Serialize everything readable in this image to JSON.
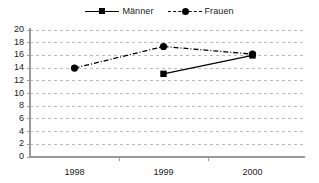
{
  "chart_data": {
    "type": "line",
    "title": "",
    "subtitle": "",
    "xlabel": "",
    "ylabel": "",
    "categories": [
      "1998",
      "1999",
      "2000"
    ],
    "ylim": [
      0,
      20
    ],
    "yticks": [
      0,
      2,
      4,
      6,
      8,
      10,
      12,
      14,
      16,
      18,
      20
    ],
    "grid": true,
    "grid_axis": "y",
    "grid_style": "dashed",
    "legend_position": "top-center",
    "series": [
      {
        "name": "Männer",
        "values": [
          null,
          13.1,
          16.0
        ],
        "line_style": "solid",
        "marker": "square",
        "color": "#000000"
      },
      {
        "name": "Frauen",
        "values": [
          14.0,
          17.4,
          16.2
        ],
        "line_style": "dash-dot",
        "marker": "circle",
        "color": "#000000"
      }
    ]
  },
  "legend": {
    "entries": [
      {
        "label": "Männer",
        "marker": "square-marker",
        "line": "solid-line"
      },
      {
        "label": "Frauen",
        "marker": "circle-marker",
        "line": "dashed-line"
      }
    ]
  },
  "axes": {
    "y_tick_labels": [
      "20",
      "18",
      "16",
      "14",
      "12",
      "10",
      "8",
      "6",
      "4",
      "2",
      "0"
    ],
    "x_tick_labels": [
      "1998",
      "1999",
      "2000"
    ]
  },
  "colors": {
    "series": "#000000",
    "grid": "#b9b9b9",
    "axis": "#999999",
    "background": "#ffffff",
    "text": "#1a1a1a"
  }
}
